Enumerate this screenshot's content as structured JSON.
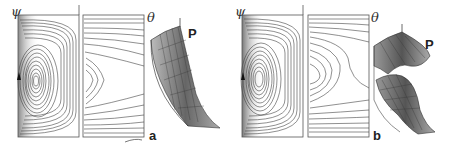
{
  "figure": {
    "panels": [
      {
        "id": "a",
        "label": "a",
        "psi_label": "ψ",
        "theta_label": "θ",
        "pressure_label": "P",
        "psi_contours": 17,
        "theta_contours": 18,
        "surface": "smooth"
      },
      {
        "id": "b",
        "label": "b",
        "psi_label": "ψ",
        "theta_label": "θ",
        "pressure_label": "P",
        "psi_contours": 17,
        "theta_contours": 18,
        "surface": "folded"
      }
    ]
  },
  "colors": {
    "line": "#444444",
    "frame": "#555555",
    "shade": "#9a9a9a",
    "background": "#ffffff"
  }
}
